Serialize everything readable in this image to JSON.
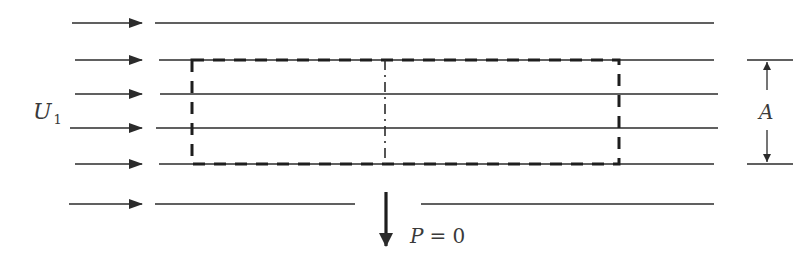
{
  "diagram": {
    "colors": {
      "stroke": "#2b2b2b",
      "background": "#ffffff",
      "text": "#3a3a3a"
    },
    "labels": {
      "inflow_velocity_symbol": "U",
      "inflow_velocity_subscript": "1",
      "area_symbol": "A",
      "power_label": "P = 0",
      "power_symbol": "P",
      "power_value": "= 0"
    },
    "streamlines": [
      {
        "y": 23,
        "arrow_x1": 72,
        "arrow_x2": 142,
        "line_x1": 155,
        "line_x2": 714
      },
      {
        "y": 60,
        "arrow_x1": 75,
        "arrow_x2": 142,
        "line_x1": 159,
        "line_x2": 714
      },
      {
        "y": 94,
        "arrow_x1": 75,
        "arrow_x2": 142,
        "line_x1": 160,
        "line_x2": 718
      },
      {
        "y": 128,
        "arrow_x1": 70,
        "arrow_x2": 142,
        "line_x1": 156,
        "line_x2": 718
      },
      {
        "y": 164,
        "arrow_x1": 75,
        "arrow_x2": 142,
        "line_x1": 159,
        "line_x2": 714
      },
      {
        "y": 204,
        "arrow_x1": 69,
        "arrow_x2": 142,
        "line_x1": 155,
        "line_x2": 714,
        "gap": [
          355,
          421
        ]
      }
    ],
    "control_volume": {
      "x1": 192,
      "y1": 60,
      "x2": 619,
      "y2": 164,
      "style": "dashed"
    },
    "disk_line": {
      "x": 385,
      "y1": 60,
      "y2": 164,
      "style": "dash-dot"
    },
    "power_arrow": {
      "x": 386,
      "y1": 192,
      "y2": 246,
      "direction": "down"
    },
    "dimension_A": {
      "x": 767,
      "y_top": 60,
      "y_bottom": 164,
      "tick_x1": 747,
      "tick_x2": 793
    }
  }
}
